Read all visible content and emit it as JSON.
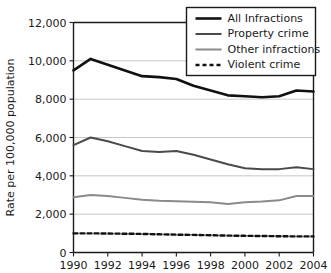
{
  "chart_data": {
    "type": "line",
    "title": "",
    "xlabel": "",
    "ylabel": "Rate per 100,000 population",
    "x": [
      1990,
      1991,
      1992,
      1993,
      1994,
      1995,
      1996,
      1997,
      1998,
      1999,
      2000,
      2001,
      2002,
      2003,
      2004
    ],
    "xlim": [
      1990,
      2004
    ],
    "ylim": [
      0,
      12000
    ],
    "grid": true,
    "legend_position": "top-right",
    "xtick_labels": [
      "1990",
      "1992",
      "1994",
      "1996",
      "1998",
      "2000",
      "2002",
      "2004"
    ],
    "xtick_values": [
      1990,
      1992,
      1994,
      1996,
      1998,
      2000,
      2002,
      2004
    ],
    "ytick_labels": [
      "0",
      "2,000",
      "4,000",
      "6,000",
      "8,000",
      "10,000",
      "12,000"
    ],
    "ytick_values": [
      0,
      2000,
      4000,
      6000,
      8000,
      10000,
      12000
    ],
    "series": [
      {
        "name": "All Infractions",
        "color": "#111111",
        "width": 2.6,
        "dash": "none",
        "values": [
          9500,
          10100,
          9800,
          9500,
          9200,
          9150,
          9050,
          8700,
          8450,
          8200,
          8150,
          8100,
          8150,
          8450,
          8400
        ]
      },
      {
        "name": "Property crime",
        "color": "#4a4a4a",
        "width": 2.0,
        "dash": "none",
        "values": [
          5600,
          6000,
          5800,
          5550,
          5300,
          5250,
          5300,
          5100,
          4850,
          4600,
          4400,
          4350,
          4350,
          4450,
          4350
        ]
      },
      {
        "name": "Other infractions",
        "color": "#8a8a8a",
        "width": 2.0,
        "dash": "none",
        "values": [
          2880,
          3000,
          2950,
          2850,
          2750,
          2700,
          2680,
          2650,
          2620,
          2530,
          2620,
          2660,
          2720,
          2950,
          2950
        ]
      },
      {
        "name": "Violent crime",
        "color": "#111111",
        "width": 2.4,
        "dash": "4 3",
        "values": [
          1000,
          1000,
          990,
          980,
          970,
          950,
          930,
          920,
          900,
          880,
          870,
          860,
          850,
          840,
          840
        ]
      }
    ]
  }
}
